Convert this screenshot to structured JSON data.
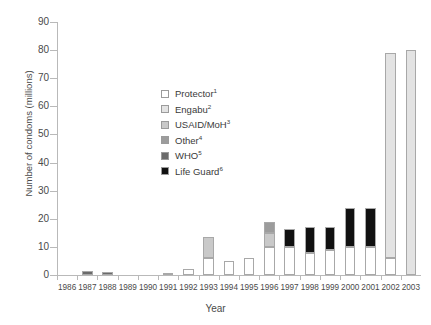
{
  "chart_data": {
    "type": "bar",
    "stacked": true,
    "title": "",
    "xlabel": "Year",
    "ylabel": "Number of condoms (millions)",
    "ylim": [
      0,
      90
    ],
    "ytick_values": [
      0,
      10,
      20,
      30,
      40,
      50,
      60,
      70,
      80,
      90
    ],
    "ytick_labels": [
      "0",
      "10",
      "20",
      "30",
      "40",
      "50",
      "60",
      "70",
      "80",
      "90"
    ],
    "grid": false,
    "legend_position": "inside-upper-left",
    "categories": [
      "1986",
      "1987",
      "1988",
      "1989",
      "1990",
      "1991",
      "1992",
      "1993",
      "1994",
      "1995",
      "1996",
      "1997",
      "1998",
      "1999",
      "2000",
      "2001",
      "2002",
      "2003"
    ],
    "series": [
      {
        "name": "Protector",
        "footnote": "1",
        "color": "#ffffff",
        "values": [
          0,
          0,
          0,
          0,
          0,
          0.5,
          2,
          6,
          5,
          6,
          10,
          10,
          8,
          9,
          10,
          10,
          6,
          0
        ]
      },
      {
        "name": "Engabu",
        "footnote": "2",
        "color": "#e3e3e3",
        "values": [
          0,
          0,
          0,
          0,
          0,
          0,
          0,
          0,
          0,
          0,
          0,
          0,
          0,
          0,
          0,
          0,
          73,
          80
        ]
      },
      {
        "name": "USAID/MoH",
        "footnote": "3",
        "color": "#c9c9c9",
        "values": [
          0,
          0,
          0,
          0,
          0,
          0,
          0,
          7.5,
          0,
          0,
          5,
          0,
          0,
          0,
          0,
          0,
          0,
          0
        ]
      },
      {
        "name": "Other",
        "footnote": "4",
        "color": "#9c9c9c",
        "values": [
          0,
          0,
          0,
          0,
          0,
          0,
          0,
          0,
          0,
          0,
          4,
          0,
          0,
          0,
          0,
          0,
          0,
          0
        ]
      },
      {
        "name": "WHO",
        "footnote": "5",
        "color": "#6b6b6b",
        "values": [
          0,
          1.5,
          1,
          0,
          0,
          0,
          0,
          0,
          0,
          0,
          0,
          0,
          0,
          0,
          0,
          0,
          0,
          0
        ]
      },
      {
        "name": "Life Guard",
        "footnote": "6",
        "color": "#111111",
        "values": [
          0,
          0,
          0,
          0,
          0,
          0,
          0,
          0,
          0,
          0,
          0,
          6.5,
          9,
          8,
          14,
          14,
          0,
          0
        ]
      }
    ],
    "totals": [
      0,
      1.5,
      1,
      0,
      0,
      0.5,
      2,
      13.5,
      5,
      6,
      19,
      16.5,
      17,
      17,
      24,
      24,
      79,
      80
    ]
  }
}
